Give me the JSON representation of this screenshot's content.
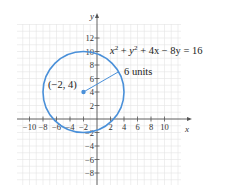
{
  "chart_data": {
    "type": "scatter",
    "title": "",
    "xlabel": "x",
    "ylabel": "y",
    "xlim": [
      -11,
      13
    ],
    "ylim": [
      -9.8,
      14
    ],
    "grid": true,
    "x_ticks": [
      -10,
      -8,
      -6,
      -4,
      -2,
      2,
      4,
      6,
      8,
      10
    ],
    "x_tick_labels": [
      "−10",
      "−8",
      "−6",
      "−4",
      "−2",
      "2",
      "4",
      "6",
      "8",
      "10"
    ],
    "y_ticks": [
      12,
      10,
      8,
      6,
      4,
      2,
      -2,
      -4,
      -6,
      -8
    ],
    "y_tick_labels": [
      "12",
      "10",
      "8",
      "6",
      "4",
      "2",
      "−2",
      "−4",
      "−6",
      "−8"
    ],
    "circle": {
      "equation": "x² + y² + 4x − 8y = 16",
      "center": [
        -2,
        4
      ],
      "radius": 6,
      "color": "#4a90d9"
    },
    "center_point": {
      "x": -2,
      "y": 4,
      "label": "(−2, 4)"
    },
    "radius_annotation": {
      "label": "6 units",
      "from": [
        -2,
        4
      ],
      "to": [
        3.2,
        7
      ]
    },
    "series": [
      {
        "name": "center",
        "values": [
          [
            -2,
            4
          ]
        ]
      }
    ]
  },
  "labels": {
    "x_axis": "x",
    "y_axis": "y",
    "equation_parts": {
      "x": "x",
      "sup2a": "2",
      "plus1": " + ",
      "y": "y",
      "sup2b": "2",
      "rest": " + 4x − 8y = 16"
    },
    "center_label": "(−2, 4)",
    "radius_label": "6 units"
  },
  "colors": {
    "circle": "#4a90d9",
    "grid": "#e4e4e4",
    "axis": "#555555"
  }
}
